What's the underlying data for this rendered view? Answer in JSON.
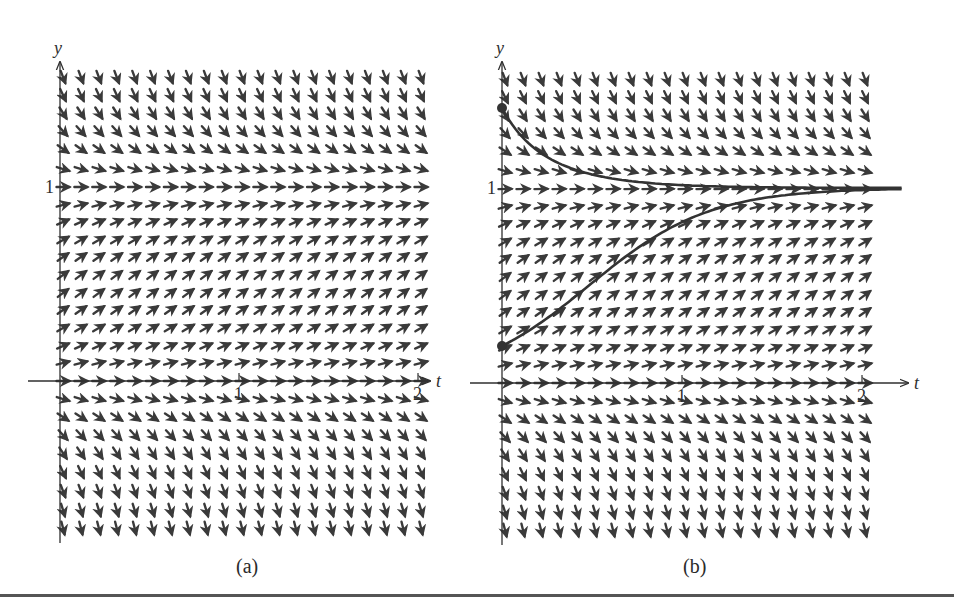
{
  "figure": {
    "panels": [
      {
        "id": "a",
        "caption": "(a)",
        "x_axis_label": "t",
        "y_axis_label": "y",
        "x_ticks": [
          "1",
          "2"
        ],
        "y_ticks": [
          "1"
        ],
        "origin_px": [
          60,
          381
        ],
        "t_unit_px": 179,
        "y_unit_px": 194,
        "axis_extent_px": {
          "x_left": 28,
          "x_right": 430,
          "y_top": 62,
          "y_bottom": 543
        },
        "caption_px": [
          248,
          567
        ],
        "solution_curves": []
      },
      {
        "id": "b",
        "caption": "(b)",
        "x_axis_label": "t",
        "y_axis_label": "y",
        "x_ticks": [
          "1",
          "2"
        ],
        "y_ticks": [
          "1"
        ],
        "origin_px": [
          502,
          383
        ],
        "t_unit_px": 180,
        "y_unit_px": 195,
        "axis_extent_px": {
          "x_left": 470,
          "x_right": 908,
          "y_top": 62,
          "y_bottom": 545
        },
        "caption_px": [
          695,
          567
        ],
        "solution_curves": [
          {
            "y0": 1.41,
            "t_end": 2.22,
            "rate": 3.0
          },
          {
            "y0": 0.19,
            "t_end": 2.22,
            "rate": 3.0
          }
        ]
      }
    ],
    "slope_field": {
      "equation": "dy/dt = y(1 - y)",
      "t_start": 0.0,
      "t_step": 0.1,
      "t_count": 21,
      "row_y_px_offsets": [
        -304,
        -286,
        -268,
        -250,
        -232,
        -212,
        -194,
        -176,
        -159,
        -141,
        -124,
        -106,
        -88,
        -71,
        -53,
        -35,
        -18,
        0,
        18,
        36,
        54,
        72,
        91,
        110,
        129,
        147
      ],
      "slope_visual_scale": 3.0
    },
    "colors": {
      "ink": "#2f2f2f",
      "arrow": "#3a3a3a",
      "curve": "#333333",
      "background": "#ffffff"
    }
  },
  "chart_data": {
    "type": "slope_field",
    "title": "",
    "equation": "dy/dt = y(1 - y)",
    "xlabel": "t",
    "ylabel": "y",
    "xlim": [
      0,
      2.2
    ],
    "ylim": [
      -0.8,
      1.6
    ],
    "x_ticks": [
      1,
      2
    ],
    "y_ticks": [
      1
    ],
    "grid_t": [
      0,
      0.1,
      0.2,
      0.3,
      0.4,
      0.5,
      0.6,
      0.7,
      0.8,
      0.9,
      1.0,
      1.1,
      1.2,
      1.3,
      1.4,
      1.5,
      1.6,
      1.7,
      1.8,
      1.9,
      2.0
    ],
    "equilibria": [
      0,
      1
    ],
    "panels": [
      {
        "label": "(a)",
        "content": "slope field only"
      },
      {
        "label": "(b)",
        "content": "slope field with two solution curves",
        "solutions": [
          {
            "initial_condition": {
              "t": 0,
              "y": 1.4
            },
            "behavior": "decreases toward y=1"
          },
          {
            "initial_condition": {
              "t": 0,
              "y": 0.2
            },
            "behavior": "increases toward y=1"
          }
        ]
      }
    ]
  }
}
